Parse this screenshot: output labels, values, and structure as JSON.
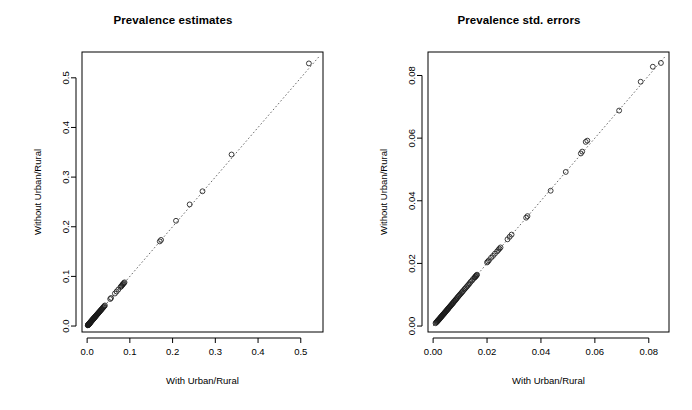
{
  "figure": {
    "background": "#ffffff",
    "point_color": "#1a1a1a",
    "refline_color": "#5a5a5a",
    "axis_color": "#000000"
  },
  "panels": [
    {
      "id": "prevalence-estimates",
      "title": "Prevalence estimates",
      "xlabel": "With Urban/Rural",
      "ylabel": "Without Urban/Rural"
    },
    {
      "id": "prevalence-std-errors",
      "title": "Prevalence std. errors",
      "xlabel": "With Urban/Rural",
      "ylabel": "Without Urban/Rural"
    }
  ],
  "chart_data": [
    {
      "type": "scatter",
      "title": "Prevalence estimates",
      "xlabel": "With Urban/Rural",
      "ylabel": "Without Urban/Rural",
      "xlim": [
        -0.012,
        0.552
      ],
      "ylim": [
        -0.012,
        0.552
      ],
      "xticks": [
        0.0,
        0.1,
        0.2,
        0.3,
        0.4,
        0.5
      ],
      "xticklabels": [
        "0.0",
        "0.1",
        "0.2",
        "0.3",
        "0.4",
        "0.5"
      ],
      "yticks": [
        0.0,
        0.1,
        0.2,
        0.3,
        0.4,
        0.5
      ],
      "yticklabels": [
        "0.0",
        "0.1",
        "0.2",
        "0.3",
        "0.4",
        "0.5"
      ],
      "grid": false,
      "legend": false,
      "marker": "open-circle",
      "annotations": [
        {
          "type": "reference-line",
          "label": "y = x",
          "style": "dotted",
          "from": [
            0.0,
            0.0
          ],
          "to": [
            0.545,
            0.545
          ]
        }
      ],
      "x": [
        0.0015,
        0.0018,
        0.0021,
        0.0024,
        0.0026,
        0.0029,
        0.0031,
        0.0034,
        0.0036,
        0.0039,
        0.0041,
        0.0044,
        0.0046,
        0.0049,
        0.0052,
        0.0054,
        0.0057,
        0.006,
        0.0063,
        0.0066,
        0.0069,
        0.0072,
        0.0075,
        0.0078,
        0.0081,
        0.0085,
        0.0088,
        0.0092,
        0.0095,
        0.0099,
        0.0103,
        0.0107,
        0.0111,
        0.0115,
        0.0119,
        0.0124,
        0.0128,
        0.0133,
        0.0138,
        0.0143,
        0.0148,
        0.0154,
        0.0159,
        0.0165,
        0.0171,
        0.0177,
        0.0184,
        0.019,
        0.0197,
        0.0204,
        0.0212,
        0.0219,
        0.0227,
        0.0235,
        0.0243,
        0.0252,
        0.0261,
        0.027,
        0.028,
        0.029,
        0.03,
        0.0312,
        0.0323,
        0.0335,
        0.0347,
        0.036,
        0.0373,
        0.0387,
        0.0401,
        0.0416,
        0.054,
        0.056,
        0.065,
        0.069,
        0.073,
        0.078,
        0.08,
        0.0815,
        0.083,
        0.0845,
        0.086,
        0.0875,
        0.17,
        0.173,
        0.208,
        0.24,
        0.27,
        0.338,
        0.519
      ],
      "y": [
        0.0014,
        0.0017,
        0.002,
        0.0023,
        0.0026,
        0.0028,
        0.0031,
        0.0033,
        0.0036,
        0.0038,
        0.0041,
        0.0043,
        0.0046,
        0.0049,
        0.0051,
        0.0054,
        0.0057,
        0.0059,
        0.0062,
        0.0065,
        0.0068,
        0.0071,
        0.0074,
        0.0077,
        0.0081,
        0.0084,
        0.0088,
        0.0091,
        0.0095,
        0.0098,
        0.0102,
        0.0106,
        0.011,
        0.0114,
        0.0119,
        0.0123,
        0.0128,
        0.0132,
        0.0137,
        0.0142,
        0.0148,
        0.0153,
        0.0159,
        0.0164,
        0.017,
        0.0177,
        0.0183,
        0.019,
        0.0196,
        0.0204,
        0.0211,
        0.0219,
        0.0226,
        0.0235,
        0.0243,
        0.0251,
        0.026,
        0.027,
        0.0279,
        0.0289,
        0.03,
        0.0311,
        0.0322,
        0.0334,
        0.0346,
        0.0359,
        0.0372,
        0.0386,
        0.04,
        0.0415,
        0.0545,
        0.0565,
        0.0655,
        0.0695,
        0.0735,
        0.0785,
        0.08,
        0.082,
        0.0835,
        0.085,
        0.0865,
        0.088,
        0.1705,
        0.1735,
        0.212,
        0.245,
        0.2715,
        0.3455,
        0.529
      ]
    },
    {
      "type": "scatter",
      "title": "Prevalence std. errors",
      "xlabel": "With Urban/Rural",
      "ylabel": "Without Urban/Rural",
      "xlim": [
        -0.0019,
        0.0875
      ],
      "ylim": [
        -0.0019,
        0.0875
      ],
      "xticks": [
        0.0,
        0.02,
        0.04,
        0.06,
        0.08
      ],
      "xticklabels": [
        "0.00",
        "0.02",
        "0.04",
        "0.06",
        "0.08"
      ],
      "yticks": [
        0.0,
        0.02,
        0.04,
        0.06,
        0.08
      ],
      "yticklabels": [
        "0.00",
        "0.02",
        "0.04",
        "0.06",
        "0.08"
      ],
      "grid": false,
      "legend": false,
      "marker": "open-circle",
      "annotations": [
        {
          "type": "reference-line",
          "label": "y = x",
          "style": "dotted",
          "from": [
            0.0,
            0.0
          ],
          "to": [
            0.0862,
            0.0862
          ]
        }
      ],
      "x": [
        0.0009,
        0.0011,
        0.0013,
        0.0015,
        0.0016,
        0.0018,
        0.0019,
        0.0021,
        0.0022,
        0.0024,
        0.0025,
        0.0027,
        0.0028,
        0.003,
        0.0031,
        0.0033,
        0.0034,
        0.0036,
        0.0037,
        0.0039,
        0.004,
        0.0042,
        0.0043,
        0.0045,
        0.0046,
        0.0048,
        0.005,
        0.0051,
        0.0053,
        0.0055,
        0.0056,
        0.0058,
        0.006,
        0.0062,
        0.0064,
        0.0066,
        0.0068,
        0.007,
        0.0072,
        0.0074,
        0.0076,
        0.0078,
        0.0081,
        0.0083,
        0.0086,
        0.0088,
        0.0091,
        0.0094,
        0.0097,
        0.01,
        0.0103,
        0.0106,
        0.0109,
        0.0112,
        0.0116,
        0.0119,
        0.0123,
        0.0127,
        0.0131,
        0.0135,
        0.0139,
        0.0144,
        0.0148,
        0.0153,
        0.0155,
        0.0157,
        0.0159,
        0.0161,
        0.0163,
        0.02,
        0.0203,
        0.0207,
        0.0215,
        0.0222,
        0.0229,
        0.0237,
        0.0242,
        0.0246,
        0.025,
        0.0276,
        0.0284,
        0.0291,
        0.0345,
        0.035,
        0.0436,
        0.0492,
        0.0548,
        0.0553,
        0.0566,
        0.0572,
        0.069,
        0.077,
        0.0815,
        0.0845
      ],
      "y": [
        0.0009,
        0.0011,
        0.0013,
        0.0014,
        0.0016,
        0.0017,
        0.0019,
        0.002,
        0.0022,
        0.0023,
        0.0025,
        0.0026,
        0.0028,
        0.0029,
        0.0031,
        0.0032,
        0.0034,
        0.0035,
        0.0037,
        0.0038,
        0.004,
        0.0041,
        0.0043,
        0.0044,
        0.0046,
        0.0048,
        0.0049,
        0.0051,
        0.0053,
        0.0054,
        0.0056,
        0.0058,
        0.006,
        0.0062,
        0.0064,
        0.0066,
        0.0068,
        0.007,
        0.0072,
        0.0074,
        0.0076,
        0.0079,
        0.0081,
        0.0084,
        0.0086,
        0.0089,
        0.0092,
        0.0095,
        0.0098,
        0.0101,
        0.0104,
        0.0107,
        0.011,
        0.0113,
        0.0117,
        0.012,
        0.0124,
        0.0128,
        0.0132,
        0.0136,
        0.0141,
        0.0145,
        0.015,
        0.0154,
        0.0156,
        0.0158,
        0.016,
        0.0162,
        0.0164,
        0.0203,
        0.0206,
        0.021,
        0.0218,
        0.0224,
        0.0231,
        0.0238,
        0.0243,
        0.0247,
        0.0251,
        0.0277,
        0.0285,
        0.0292,
        0.0346,
        0.0351,
        0.0432,
        0.0492,
        0.0551,
        0.0557,
        0.0588,
        0.0592,
        0.0688,
        0.078,
        0.0828,
        0.084
      ]
    }
  ]
}
